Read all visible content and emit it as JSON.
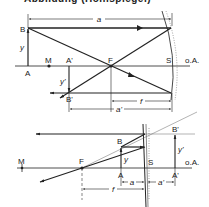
{
  "caption": "Abbildung (Hohlspiegel)",
  "diagram_top": {
    "title": "Concave mirror, object outside focal length",
    "labels": {
      "B": "B",
      "A": "A",
      "M": "M",
      "A_prime": "A'",
      "B_prime": "B'",
      "F": "F",
      "S": "S",
      "axis": "o.A.",
      "y": "y",
      "y_prime": "y'",
      "a": "a",
      "a_prime": "a'",
      "f": "f"
    }
  },
  "diagram_bottom": {
    "title": "Concave mirror, object inside focal length (virtual image)",
    "labels": {
      "M": "M",
      "F": "F",
      "B": "B",
      "A": "A",
      "S": "S",
      "B_prime": "B'",
      "A_prime": "A'",
      "axis": "o.A.",
      "y": "y",
      "y_prime": "y'",
      "a": "a",
      "a_prime": "a'",
      "f": "f"
    }
  },
  "colors": {
    "line": "#222222",
    "dashed": "#555555",
    "background": "#ffffff"
  }
}
